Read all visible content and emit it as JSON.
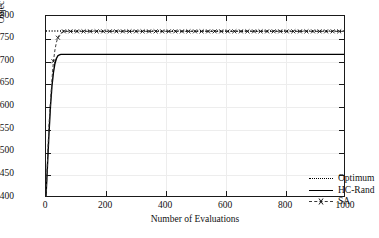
{
  "chart_data": {
    "type": "line",
    "title": "",
    "xlabel": "Number of Evaluations",
    "ylabel": "Objective Value",
    "xlim": [
      0,
      1000
    ],
    "ylim": [
      400,
      800
    ],
    "xticks": [
      0,
      200,
      400,
      600,
      800,
      1000
    ],
    "yticks": [
      400,
      450,
      500,
      550,
      600,
      650,
      700,
      750,
      800
    ],
    "grid": true,
    "legend_position": "lower right",
    "series": [
      {
        "name": "Optimum",
        "style": "dotted",
        "color": "#000000",
        "marker": "none",
        "constant_value": 767,
        "x": [
          0,
          1000
        ],
        "values": [
          767,
          767
        ]
      },
      {
        "name": "HC-Rand",
        "style": "solid",
        "color": "#000000",
        "marker": "none",
        "plateau_value": 715,
        "x": [
          0,
          5,
          10,
          15,
          20,
          25,
          30,
          35,
          40,
          45,
          50,
          60,
          80,
          100,
          200,
          400,
          600,
          800,
          1000
        ],
        "values": [
          400,
          470,
          540,
          600,
          645,
          675,
          695,
          706,
          712,
          714,
          715,
          715,
          715,
          715,
          715,
          715,
          715,
          715,
          715
        ]
      },
      {
        "name": "SA",
        "style": "dashed",
        "color": "#333333",
        "marker": "x",
        "plateau_value": 766,
        "x": [
          0,
          10,
          20,
          25,
          30,
          35,
          40,
          45,
          50,
          55,
          60,
          70,
          100,
          200,
          400,
          600,
          800,
          1000
        ],
        "values": [
          400,
          560,
          660,
          700,
          725,
          742,
          752,
          758,
          762,
          764,
          766,
          766,
          766,
          766,
          766,
          766,
          766,
          766
        ]
      }
    ]
  },
  "axes": {
    "y_tick_labels": [
      "800",
      "750",
      "700",
      "650",
      "600",
      "550",
      "500",
      "450",
      "400"
    ],
    "x_tick_labels": [
      "0",
      "200",
      "400",
      "600",
      "800",
      "1000"
    ],
    "y_title": "Objective Value",
    "x_title": "Number of Evaluations"
  },
  "legend": {
    "entries": [
      {
        "label": "Optimum"
      },
      {
        "label": "HC-Rand"
      },
      {
        "label": "SA"
      }
    ]
  }
}
